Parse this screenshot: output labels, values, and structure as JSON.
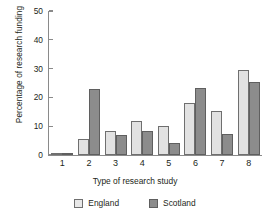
{
  "chart_data": {
    "type": "bar",
    "title": "",
    "xlabel": "Type of research study",
    "ylabel": "Percentage of research funding",
    "categories": [
      "1",
      "2",
      "3",
      "4",
      "5",
      "6",
      "7",
      "8"
    ],
    "series": [
      {
        "name": "England",
        "color": "#e2e2e2",
        "values": [
          0.8,
          5.6,
          8.2,
          11.7,
          10.0,
          17.9,
          15.3,
          29.4
        ]
      },
      {
        "name": "Scotland",
        "color": "#8c8c8c",
        "values": [
          0.6,
          22.9,
          7.0,
          8.2,
          4.2,
          23.2,
          7.4,
          25.3
        ]
      }
    ],
    "ylim": [
      0,
      50
    ],
    "yticks": [
      "0",
      "10",
      "20",
      "30",
      "40",
      "50"
    ],
    "grid": false,
    "legend_position": "bottom"
  }
}
